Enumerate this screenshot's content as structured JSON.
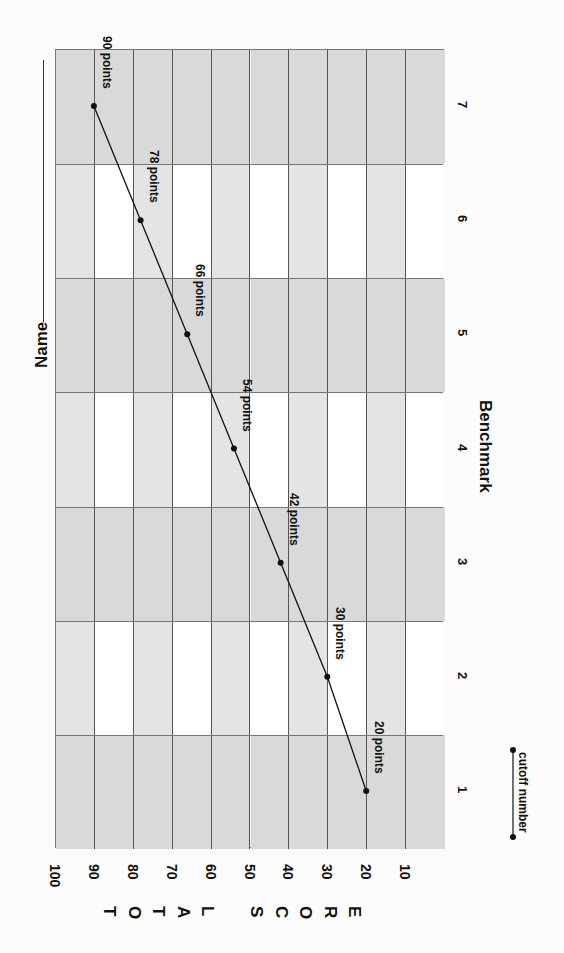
{
  "header": {
    "name_label": "Name"
  },
  "legend": {
    "label": "cutoff number"
  },
  "chart_data": {
    "type": "line",
    "title": "",
    "xlabel": "Benchmark",
    "ylabel": "TOTAL SCORE",
    "categories": [
      "1",
      "2",
      "3",
      "4",
      "5",
      "6",
      "7"
    ],
    "series": [
      {
        "name": "cutoff number",
        "values": [
          20,
          30,
          42,
          54,
          66,
          78,
          90
        ],
        "labels": [
          "20 points",
          "30 points",
          "42 points",
          "54 points",
          "66 points",
          "78 points",
          "90 points"
        ]
      }
    ],
    "ylim": [
      0,
      100
    ],
    "yticks": [
      "100",
      "90",
      "80",
      "70",
      "60",
      "50",
      "40",
      "30",
      "20",
      "10"
    ],
    "orientation": "rotated 90 degrees clockwise",
    "grid": true,
    "band_colors": {
      "shaded": "#d9d9d9",
      "light": "#e4e4e4",
      "white": "#ffffff"
    },
    "line_color": "#111111"
  },
  "axis": {
    "score_letters": [
      "T",
      "O",
      "T",
      "A",
      "L",
      "",
      "S",
      "C",
      "O",
      "R",
      "E"
    ]
  }
}
